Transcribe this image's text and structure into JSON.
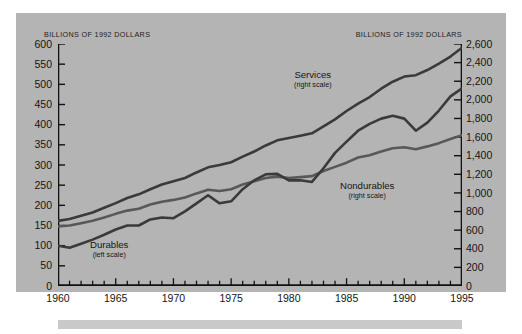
{
  "panel": {
    "background_color": "#b4b4b4",
    "page_background": "#ffffff",
    "footer_bar_color": "#c9c9c9"
  },
  "axis_titles": {
    "left": "BILLIONS OF 1992 DOLLARS",
    "right": "BILLIONS OF 1992 DOLLARS"
  },
  "series_labels": {
    "services": {
      "name": "Services",
      "scale": "(right scale)"
    },
    "nondurables": {
      "name": "Nondurables",
      "scale": "(right scale)"
    },
    "durables": {
      "name": "Durables",
      "scale": "(left scale)"
    }
  },
  "chart_data": {
    "type": "line",
    "title": "",
    "subtitle": "",
    "xlabel": "",
    "ylabel": "BILLIONS OF 1992 DOLLARS",
    "y2label": "BILLIONS OF 1992 DOLLARS",
    "grid": false,
    "legend": "inline-annotations",
    "xlim": [
      1960,
      1995
    ],
    "ylim": [
      0,
      600
    ],
    "y2lim": [
      0,
      2600
    ],
    "x_ticks_major": [
      1960,
      1965,
      1970,
      1975,
      1980,
      1985,
      1990,
      1995
    ],
    "x_ticks_minor_step": 1,
    "y_ticks_left": [
      0,
      50,
      100,
      150,
      200,
      250,
      300,
      350,
      400,
      450,
      500,
      550,
      600
    ],
    "y_ticks_right": [
      "0",
      "200",
      "400",
      "600",
      "800",
      "1,000",
      "1,200",
      "1,400",
      "1,600",
      "1,800",
      "2,000",
      "2,200",
      "2,400",
      "2,600"
    ],
    "y_tick_labels_left": [
      "0",
      "50",
      "100",
      "150",
      "200",
      "250",
      "300",
      "350",
      "400",
      "450",
      "500",
      "550",
      "600"
    ],
    "line_color_dark": "#3a3a3a",
    "line_color_mid": "#555555",
    "x": [
      1960,
      1961,
      1962,
      1963,
      1964,
      1965,
      1966,
      1967,
      1968,
      1969,
      1970,
      1971,
      1972,
      1973,
      1974,
      1975,
      1976,
      1977,
      1978,
      1979,
      1980,
      1981,
      1982,
      1983,
      1984,
      1985,
      1986,
      1987,
      1988,
      1989,
      1990,
      1991,
      1992,
      1993,
      1994,
      1995
    ],
    "series": [
      {
        "name": "Services",
        "axis": "right",
        "units": "billions of 1992 dollars",
        "values": [
          700,
          720,
          755,
          790,
          840,
          890,
          945,
          985,
          1040,
          1090,
          1125,
          1160,
          1220,
          1275,
          1300,
          1330,
          1390,
          1445,
          1510,
          1565,
          1590,
          1615,
          1640,
          1715,
          1790,
          1880,
          1960,
          2030,
          2120,
          2195,
          2250,
          2265,
          2320,
          2390,
          2465,
          2560
        ]
      },
      {
        "name": "Nondurables",
        "axis": "right",
        "units": "billions of 1992 dollars",
        "values": [
          640,
          650,
          675,
          700,
          735,
          775,
          810,
          830,
          875,
          905,
          925,
          950,
          995,
          1035,
          1020,
          1040,
          1090,
          1125,
          1160,
          1175,
          1160,
          1170,
          1180,
          1235,
          1280,
          1325,
          1380,
          1405,
          1445,
          1480,
          1490,
          1470,
          1500,
          1535,
          1580,
          1620
        ]
      },
      {
        "name": "Durables",
        "axis": "left",
        "units": "billions of 1992 dollars",
        "values": [
          100,
          95,
          105,
          115,
          127,
          140,
          150,
          150,
          165,
          170,
          168,
          185,
          205,
          225,
          205,
          210,
          240,
          262,
          277,
          278,
          262,
          262,
          258,
          292,
          330,
          358,
          385,
          402,
          415,
          422,
          415,
          385,
          405,
          435,
          470,
          490
        ]
      }
    ]
  }
}
